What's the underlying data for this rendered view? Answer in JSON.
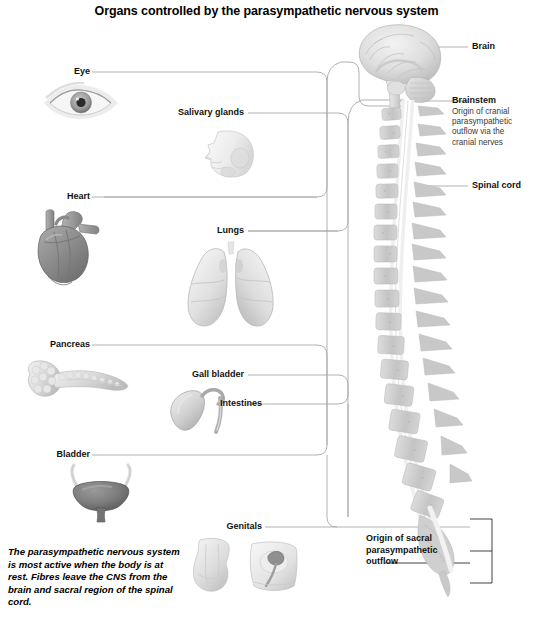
{
  "figure": {
    "title": "Organs controlled by the parasympathetic nervous system",
    "caption": "The parasympathetic nervous system is most active when the body is at rest. Fibres leave the CNS from the brain and sacral region of the spinal cord."
  },
  "organ_labels": {
    "eye": "Eye",
    "salivary_glands": "Salivary glands",
    "heart": "Heart",
    "lungs": "Lungs",
    "pancreas": "Pancreas",
    "gall_bladder": "Gall bladder",
    "intestines": "Intestines",
    "bladder": "Bladder",
    "genitals": "Genitals"
  },
  "cns_labels": {
    "brain": "Brain",
    "brainstem": "Brainstem",
    "brainstem_note": "Origin of cranial\nparasympathetic\noutflow via the\ncranial nerves",
    "spinal_cord": "Spinal cord",
    "sacral_outflow": "Origin of sacral\nparasympathetic\noutflow"
  },
  "colors": {
    "background": "#ffffff",
    "text": "#111111",
    "subtext": "#3a3a3a",
    "connector": "#9a9a9a",
    "bone_light": "#e2e2e2",
    "bone_mid": "#c6c6c6",
    "organ_dark": "#6f6f6f",
    "organ_mid": "#b4b4b4",
    "organ_light": "#e8e8e8"
  }
}
